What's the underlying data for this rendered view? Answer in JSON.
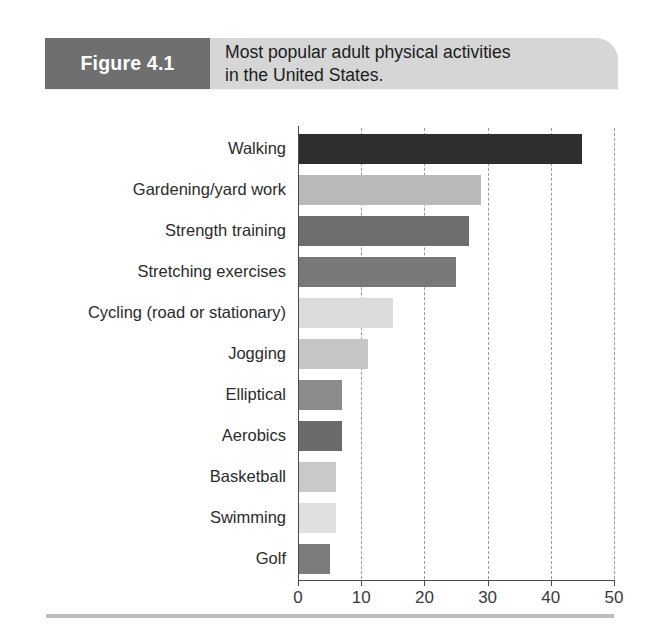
{
  "figure": {
    "number_label": "Figure 4.1",
    "caption_line1": "Most popular adult physical activities",
    "caption_line2": "in the United States."
  },
  "colors": {
    "figure_number_box": "#6f6f6f",
    "banner": "#d6d6d6",
    "axis": "#4a4a4a",
    "gridline": "#9a9a9a",
    "bottom_rule": "#bdbdbd",
    "label_text": "#2b2b2b"
  },
  "chart_data": {
    "type": "bar",
    "orientation": "horizontal",
    "title": "Most popular adult physical activities in the United States.",
    "subtitle": "",
    "xlabel": "",
    "ylabel": "",
    "xlim": [
      0,
      50
    ],
    "xticks": [
      0,
      10,
      20,
      30,
      40,
      50
    ],
    "xtick_labels": [
      "0",
      "10",
      "20",
      "30",
      "40",
      "50"
    ],
    "grid": "vertical-dashed",
    "legend": "none",
    "categories": [
      "Walking",
      "Gardening/yard work",
      "Strength training",
      "Stretching exercises",
      "Cycling (road or stationary)",
      "Jogging",
      "Elliptical",
      "Aerobics",
      "Basketball",
      "Swimming",
      "Golf"
    ],
    "values": [
      45,
      29,
      27,
      25,
      15,
      11,
      7,
      7,
      6,
      6,
      5
    ],
    "bar_colors": [
      "#2e2e2e",
      "#b9b9b9",
      "#6e6e6e",
      "#787878",
      "#dcdcdc",
      "#c6c6c6",
      "#8b8b8b",
      "#6b6b6b",
      "#c9c9c9",
      "#e0e0e0",
      "#7c7c7c"
    ]
  }
}
